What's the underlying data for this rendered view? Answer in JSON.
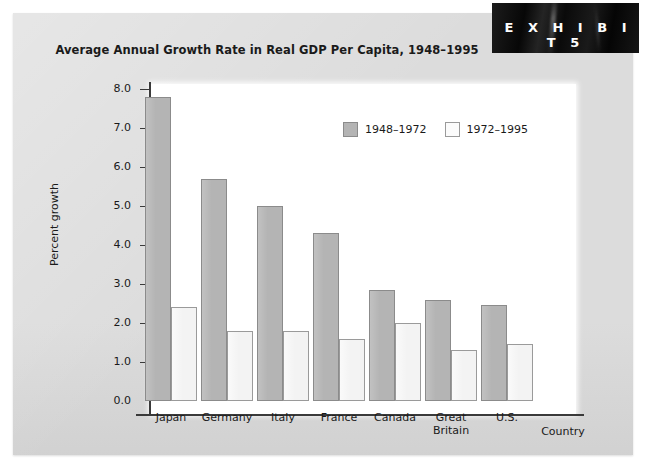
{
  "exhibit": {
    "label": "E X H I B I T   5"
  },
  "chart_data": {
    "type": "bar",
    "title": "Average Annual Growth Rate in Real GDP Per Capita, 1948–1995",
    "xlabel": "Country",
    "ylabel": "Percent growth",
    "ylim": [
      0.0,
      8.0
    ],
    "ytick_labels": [
      "0.0",
      "1.0",
      "2.0",
      "3.0",
      "4.0",
      "5.0",
      "6.0",
      "7.0",
      "8.0"
    ],
    "ytick_values": [
      0.0,
      1.0,
      2.0,
      3.0,
      4.0,
      5.0,
      6.0,
      7.0,
      8.0
    ],
    "grid": false,
    "legend_position": "upper-center",
    "categories": [
      "Japan",
      "Germany",
      "Italy",
      "France",
      "Canada",
      "Great Britain",
      "U.S."
    ],
    "category_labels": [
      [
        "Japan"
      ],
      [
        "Germany"
      ],
      [
        "Italy"
      ],
      [
        "France"
      ],
      [
        "Canada"
      ],
      [
        "Great",
        "Britain"
      ],
      [
        "U.S."
      ]
    ],
    "series": [
      {
        "name": "1948–1972",
        "color": "#b4b4b4",
        "values": [
          7.8,
          5.7,
          5.0,
          4.3,
          2.85,
          2.6,
          2.45
        ]
      },
      {
        "name": "1972–1995",
        "color": "#f3f3f3",
        "values": [
          2.4,
          1.8,
          1.8,
          1.6,
          2.0,
          1.3,
          1.45
        ]
      }
    ]
  }
}
